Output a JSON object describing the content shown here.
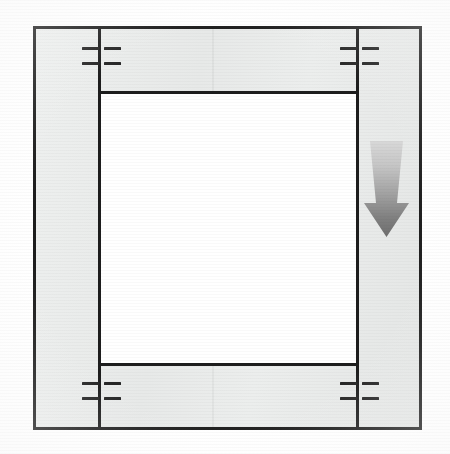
{
  "figure": {
    "type": "technical-line-drawing",
    "title": "",
    "caption": "",
    "canvas": {
      "width": 450,
      "height": 454,
      "background": "#ffffff"
    }
  },
  "colors": {
    "line": "#1d1d1d",
    "tick": "#262626",
    "frame_fill_light": "#eef0ef",
    "frame_fill_dark": "#e4e6e5",
    "opening_fill": "#ffffff",
    "arrow_top": "#d8d8d8",
    "arrow_bottom": "#6e6e6e"
  },
  "outer_frame": {
    "name": "outer frame",
    "x": 33,
    "y": 26,
    "width": 389,
    "height": 404,
    "stroke_width": 3
  },
  "inner_opening": {
    "name": "inner opening",
    "x": 98,
    "y": 91,
    "width": 261,
    "height": 275,
    "stroke_width": 3
  },
  "rails": [
    {
      "name": "left rail",
      "x": 98,
      "y": 26,
      "height": 404,
      "width": 3
    },
    {
      "name": "right rail",
      "x": 356,
      "y": 26,
      "height": 404,
      "width": 3
    }
  ],
  "seams": [
    {
      "name": "upper band seam",
      "x": 212
    },
    {
      "name": "lower band seam",
      "x": 212
    }
  ],
  "tick_groups": [
    {
      "id": "top-left",
      "x": 82,
      "y": 47,
      "rows": 2,
      "row_spacing": 15,
      "segment_width": 17,
      "gap": 5
    },
    {
      "id": "top-right",
      "x": 340,
      "y": 47,
      "rows": 2,
      "row_spacing": 15,
      "segment_width": 17,
      "gap": 5
    },
    {
      "id": "bottom-left",
      "x": 82,
      "y": 382,
      "rows": 2,
      "row_spacing": 15,
      "segment_width": 17,
      "gap": 5
    },
    {
      "id": "bottom-right",
      "x": 340,
      "y": 382,
      "rows": 2,
      "row_spacing": 15,
      "segment_width": 17,
      "gap": 5
    }
  ],
  "arrow": {
    "name": "downward flow arrow",
    "direction": "down",
    "x": 362,
    "y": 141,
    "width": 49,
    "height": 96,
    "gradient_from": "#d8d8d8",
    "gradient_to": "#6e6e6e",
    "label": ""
  },
  "labels": {
    "reference_numerals": [],
    "annotations": []
  }
}
